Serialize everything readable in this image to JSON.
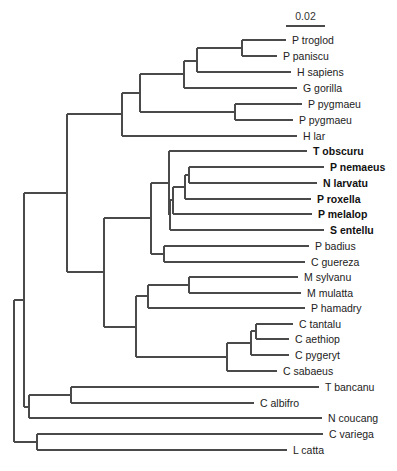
{
  "figure": {
    "type": "phylogenetic-tree",
    "scale_bar": {
      "label": "0.02",
      "x1": 286,
      "x2": 325,
      "y": 26,
      "label_y": 20
    },
    "line_color": "#4a4a4a",
    "text_color": "#222222"
  },
  "taxa": [
    {
      "name": "P troglod",
      "y": 40,
      "x_start": 242,
      "x_end": 286,
      "bold": false
    },
    {
      "name": "P paniscu",
      "y": 56,
      "x_start": 242,
      "x_end": 277,
      "bold": false
    },
    {
      "name": "H sapiens",
      "y": 72,
      "x_start": 197,
      "x_end": 291,
      "bold": false
    },
    {
      "name": "G gorilla",
      "y": 88,
      "x_start": 184,
      "x_end": 297,
      "bold": false
    },
    {
      "name": "P pygmaeu",
      "y": 104,
      "x_start": 235,
      "x_end": 302,
      "bold": false
    },
    {
      "name": "P pygmaeu",
      "y": 120,
      "x_start": 235,
      "x_end": 293,
      "bold": false
    },
    {
      "name": "H lar",
      "y": 136,
      "x_start": 122,
      "x_end": 297,
      "bold": false
    },
    {
      "name": "T obscuru",
      "y": 151,
      "x_start": 169,
      "x_end": 307,
      "bold": true
    },
    {
      "name": "P nemaeus",
      "y": 167,
      "x_start": 189,
      "x_end": 324,
      "bold": true
    },
    {
      "name": "N larvatu",
      "y": 183,
      "x_start": 189,
      "x_end": 317,
      "bold": true
    },
    {
      "name": "P roxella",
      "y": 199,
      "x_start": 185,
      "x_end": 311,
      "bold": true
    },
    {
      "name": "P melalop",
      "y": 214,
      "x_start": 173,
      "x_end": 312,
      "bold": true
    },
    {
      "name": "S entellu",
      "y": 230,
      "x_start": 170,
      "x_end": 324,
      "bold": true
    },
    {
      "name": "P badius",
      "y": 246,
      "x_start": 164,
      "x_end": 309,
      "bold": false
    },
    {
      "name": "C guereza",
      "y": 262,
      "x_start": 164,
      "x_end": 305,
      "bold": false
    },
    {
      "name": "M sylvanu",
      "y": 277,
      "x_start": 189,
      "x_end": 298,
      "bold": false
    },
    {
      "name": "M mulatta",
      "y": 293,
      "x_start": 189,
      "x_end": 301,
      "bold": false
    },
    {
      "name": "P hamadry",
      "y": 308,
      "x_start": 148,
      "x_end": 305,
      "bold": false
    },
    {
      "name": "C tantalu",
      "y": 324,
      "x_start": 256,
      "x_end": 293,
      "bold": false
    },
    {
      "name": "C aethiop",
      "y": 339,
      "x_start": 256,
      "x_end": 289,
      "bold": false
    },
    {
      "name": "C pygeryt",
      "y": 355,
      "x_start": 251,
      "x_end": 289,
      "bold": false
    },
    {
      "name": "C sabaeus",
      "y": 371,
      "x_start": 227,
      "x_end": 277,
      "bold": false
    },
    {
      "name": "T bancanu",
      "y": 387,
      "x_start": 71,
      "x_end": 319,
      "bold": false
    },
    {
      "name": "C albifro",
      "y": 403,
      "x_start": 71,
      "x_end": 254,
      "bold": false
    },
    {
      "name": "N coucang",
      "y": 418,
      "x_start": 29,
      "x_end": 322,
      "bold": false
    },
    {
      "name": "C variega",
      "y": 434,
      "x_start": 37,
      "x_end": 323,
      "bold": false
    },
    {
      "name": "L catta",
      "y": 450,
      "x_start": 37,
      "x_end": 287,
      "bold": false
    }
  ],
  "internal_nodes": [
    {
      "id": "n_pan",
      "x": 242,
      "y1": 40,
      "y2": 56,
      "parent_x": 197,
      "y": 48
    },
    {
      "id": "n_homo_pan",
      "x": 197,
      "y1": 48,
      "y2": 72,
      "parent_x": 184,
      "y": 61
    },
    {
      "id": "n_african",
      "x": 184,
      "y1": 61,
      "y2": 88,
      "parent_x": 140,
      "y": 74
    },
    {
      "id": "n_pongo",
      "x": 235,
      "y1": 104,
      "y2": 120,
      "parent_x": 140,
      "y": 112
    },
    {
      "id": "n_great_apes",
      "x": 140,
      "y1": 74,
      "y2": 112,
      "parent_x": 122,
      "y": 93
    },
    {
      "id": "n_hominoids",
      "x": 122,
      "y1": 93,
      "y2": 136,
      "parent_x": 67,
      "y": 114
    },
    {
      "id": "n_nas_nem",
      "x": 189,
      "y1": 167,
      "y2": 183,
      "parent_x": 185,
      "y": 175
    },
    {
      "id": "n_rhino",
      "x": 185,
      "y1": 175,
      "y2": 199,
      "parent_x": 173,
      "y": 187
    },
    {
      "id": "n_odd_nosed",
      "x": 173,
      "y1": 187,
      "y2": 214,
      "parent_x": 170,
      "y": 200
    },
    {
      "id": "n_asian_col",
      "x": 170,
      "y1": 200,
      "y2": 230,
      "parent_x": 169,
      "y": 215
    },
    {
      "id": "n_asian_all",
      "x": 169,
      "y1": 151,
      "y2": 215,
      "parent_x": 151,
      "y": 183
    },
    {
      "id": "n_african_col",
      "x": 164,
      "y1": 246,
      "y2": 262,
      "parent_x": 151,
      "y": 254
    },
    {
      "id": "n_colobines",
      "x": 151,
      "y1": 183,
      "y2": 254,
      "parent_x": 104,
      "y": 218
    },
    {
      "id": "n_macaca",
      "x": 189,
      "y1": 277,
      "y2": 293,
      "parent_x": 148,
      "y": 285
    },
    {
      "id": "n_papionini",
      "x": 148,
      "y1": 285,
      "y2": 308,
      "parent_x": 136,
      "y": 296
    },
    {
      "id": "n_tan_aeth",
      "x": 256,
      "y1": 324,
      "y2": 339,
      "parent_x": 251,
      "y": 331
    },
    {
      "id": "n_tan_pyg",
      "x": 251,
      "y1": 331,
      "y2": 355,
      "parent_x": 227,
      "y": 343
    },
    {
      "id": "n_chloro",
      "x": 227,
      "y1": 343,
      "y2": 371,
      "parent_x": 136,
      "y": 357
    },
    {
      "id": "n_cercopith",
      "x": 136,
      "y1": 296,
      "y2": 357,
      "parent_x": 104,
      "y": 327
    },
    {
      "id": "n_owm",
      "x": 104,
      "y1": 218,
      "y2": 327,
      "parent_x": 67,
      "y": 272
    },
    {
      "id": "n_catarrhini",
      "x": 67,
      "y1": 114,
      "y2": 272,
      "parent_x": 24,
      "y": 193
    },
    {
      "id": "n_tar_ceb",
      "x": 71,
      "y1": 387,
      "y2": 403,
      "parent_x": 29,
      "y": 395
    },
    {
      "id": "n_lorisoid",
      "x": 29,
      "y1": 395,
      "y2": 418,
      "parent_x": 24,
      "y": 407
    },
    {
      "id": "n_ingroup",
      "x": 24,
      "y1": 193,
      "y2": 407,
      "parent_x": 14,
      "y": 300
    },
    {
      "id": "n_lemur",
      "x": 37,
      "y1": 434,
      "y2": 450,
      "parent_x": 14,
      "y": 442
    },
    {
      "id": "n_root",
      "x": 14,
      "y1": 300,
      "y2": 442,
      "parent_x": null,
      "y": 371
    }
  ]
}
